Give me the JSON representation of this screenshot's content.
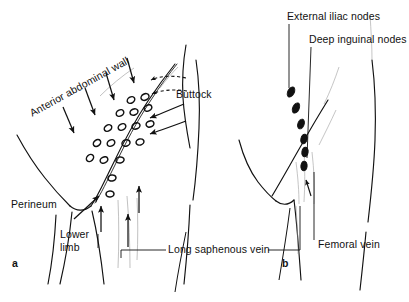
{
  "figure": {
    "type": "anatomical-line-diagram",
    "background_color": "#ffffff",
    "ink_color": "#111111",
    "panels": [
      {
        "id": "a",
        "label": "a",
        "description": "Superficial lymphatic drainage routes converging on the superficial inguinal nodes"
      },
      {
        "id": "b",
        "label": "b",
        "description": "Deep inguinal and external iliac node chain along the femoral vessels"
      }
    ]
  },
  "panel_a": {
    "id_label": "a",
    "labels": {
      "anterior_abdominal_wall": "Anterior abdominal wall",
      "buttock": "Buttock",
      "perineum": "Perineum",
      "lower_limb_line1": "Lower",
      "lower_limb_line2": "limb",
      "long_saphenous_vein": "Long saphenous vein"
    },
    "node_count": 18,
    "arrow_groups": [
      {
        "name": "abdominal-wall-arrows",
        "count": 4,
        "direction": "down-right"
      },
      {
        "name": "buttock-arrows",
        "count": 2,
        "direction": "left"
      },
      {
        "name": "buttock-dashed-arrows",
        "count": 2,
        "direction": "left"
      },
      {
        "name": "perineum-arrow",
        "count": 1,
        "direction": "up-right"
      },
      {
        "name": "lower-limb-arrows",
        "count": 3,
        "direction": "up"
      }
    ]
  },
  "panel_b": {
    "id_label": "b",
    "labels": {
      "external_iliac_nodes": "External iliac nodes",
      "deep_inguinal_nodes": "Deep inguinal nodes",
      "femoral_vein": "Femoral vein"
    },
    "node_count": 6,
    "arrow_groups": [
      {
        "name": "deep-ascending-arrow",
        "count": 1,
        "direction": "up"
      }
    ]
  }
}
